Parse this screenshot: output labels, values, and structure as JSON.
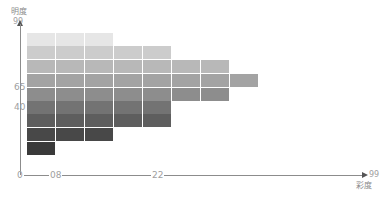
{
  "chart_data": {
    "type": "heatmap",
    "title": "",
    "ylabel": "明度",
    "xlabel": "彩度",
    "y_ticks": [
      "99",
      "65",
      "40",
      "0"
    ],
    "x_ticks": [
      "0",
      "08",
      "22",
      "99"
    ],
    "ylim": [
      0,
      99
    ],
    "xlim": [
      0,
      99
    ],
    "grid": false,
    "rows": [
      {
        "row": 1,
        "cells": 3,
        "color": "#e6e6e6"
      },
      {
        "row": 2,
        "cells": 5,
        "color": "#cccccc"
      },
      {
        "row": 3,
        "cells": 7,
        "color": "#b8b8b8"
      },
      {
        "row": 4,
        "cells": 8,
        "color": "#a3a3a3"
      },
      {
        "row": 5,
        "cells": 7,
        "color": "#8d8d8d"
      },
      {
        "row": 6,
        "cells": 5,
        "color": "#737373"
      },
      {
        "row": 7,
        "cells": 5,
        "color": "#5e5e5e"
      },
      {
        "row": 8,
        "cells": 3,
        "color": "#484848"
      },
      {
        "row": 9,
        "cells": 1,
        "color": "#3a3a3a"
      }
    ],
    "row_cell_counts": [
      3,
      5,
      7,
      8,
      7,
      5,
      5,
      3,
      1
    ]
  },
  "labels": {
    "y_axis_title": "明度",
    "x_axis_title": "彩度",
    "y_tick_99": "99",
    "y_tick_65": "65",
    "y_tick_40": "40",
    "origin": "0",
    "x_tick_08": "08",
    "x_tick_22": "22",
    "x_tick_99": "99"
  }
}
